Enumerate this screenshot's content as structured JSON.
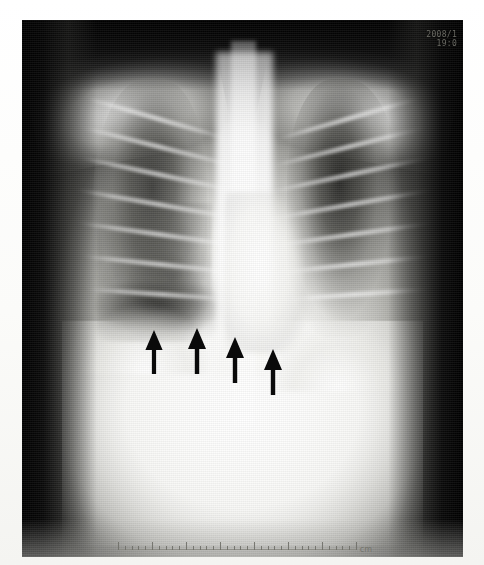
{
  "image": {
    "modality": "chest-radiograph",
    "view": "PA frontal chest X-ray",
    "media": "photographic print of radiograph on white paper border"
  },
  "overlay": {
    "timestamp_date": "2008/1",
    "timestamp_time": "19:0"
  },
  "ruler": {
    "unit_label": "cm",
    "major_divisions": 7,
    "minor_per_major": 5,
    "length_px": 238
  },
  "annotations": {
    "marker_color": "#0a0a0a",
    "description": "four solid black arrows pointing upward at right lower zone opacity",
    "arrows": [
      {
        "name": "arrow-1",
        "left": 143,
        "top": 330,
        "width": 22,
        "height": 44,
        "tip_y": 330
      },
      {
        "name": "arrow-2",
        "left": 186,
        "top": 328,
        "width": 22,
        "height": 46,
        "tip_y": 328
      },
      {
        "name": "arrow-3",
        "left": 224,
        "top": 337,
        "width": 22,
        "height": 46,
        "tip_y": 337
      },
      {
        "name": "arrow-4",
        "left": 262,
        "top": 349,
        "width": 22,
        "height": 46,
        "tip_y": 349
      }
    ]
  },
  "anatomy": {
    "regions": [
      {
        "name": "right-lung-field",
        "note": "mottled reticulonodular opacity, reduced lucency"
      },
      {
        "name": "left-lung-field",
        "note": "darker, relatively clear upper zone"
      },
      {
        "name": "mediastinum",
        "note": "bright central column, spine and trachea"
      },
      {
        "name": "cardiac-silhouette",
        "note": "left heart border"
      },
      {
        "name": "right-hemidiaphragm",
        "note": "obscured silhouette at arrow level"
      },
      {
        "name": "left-hemidiaphragm",
        "note": "preserved dome"
      },
      {
        "name": "clavicles-shoulders",
        "note": "upper bony girdle"
      },
      {
        "name": "abdomen",
        "note": "uniform bright sub-diaphragmatic field"
      }
    ],
    "ribs_right": [
      {
        "top": 96,
        "left": 60,
        "width": 150,
        "rotate": 16
      },
      {
        "top": 124,
        "left": 56,
        "width": 160,
        "rotate": 14
      },
      {
        "top": 152,
        "left": 54,
        "width": 166,
        "rotate": 12
      },
      {
        "top": 182,
        "left": 52,
        "width": 170,
        "rotate": 10
      },
      {
        "top": 212,
        "left": 54,
        "width": 168,
        "rotate": 8
      },
      {
        "top": 242,
        "left": 58,
        "width": 162,
        "rotate": 6
      },
      {
        "top": 272,
        "left": 64,
        "width": 154,
        "rotate": 4
      }
    ],
    "ribs_left": [
      {
        "top": 96,
        "left": 252,
        "width": 150,
        "rotate": -16
      },
      {
        "top": 124,
        "left": 248,
        "width": 160,
        "rotate": -14
      },
      {
        "top": 152,
        "left": 246,
        "width": 166,
        "rotate": -12
      },
      {
        "top": 182,
        "left": 244,
        "width": 170,
        "rotate": -10
      },
      {
        "top": 212,
        "left": 246,
        "width": 168,
        "rotate": -8
      },
      {
        "top": 242,
        "left": 250,
        "width": 162,
        "rotate": -6
      },
      {
        "top": 272,
        "left": 256,
        "width": 154,
        "rotate": -4
      }
    ]
  },
  "colors": {
    "paper": "#fdfdfb",
    "film_dark": "#050505",
    "film_bright": "#ffffff",
    "arrow": "#0a0a0a",
    "ruler_ink": "#6f6f68",
    "timestamp_text": "#8d8d84"
  }
}
